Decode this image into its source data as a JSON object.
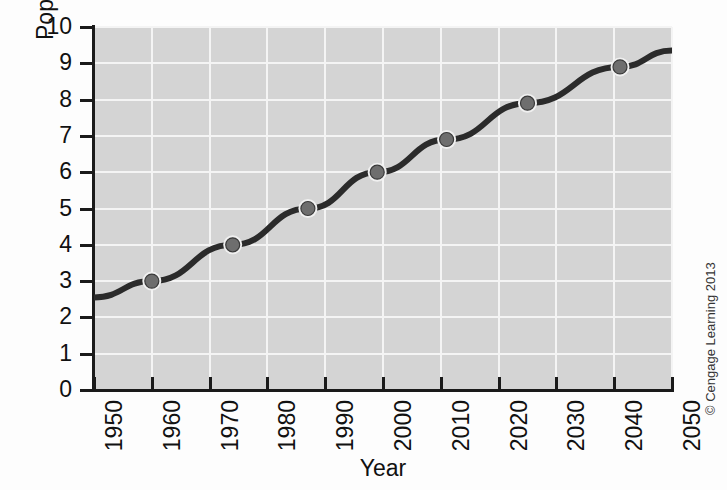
{
  "chart_data": {
    "type": "line",
    "title": "",
    "xlabel": "Year",
    "ylabel": "Population (billions)",
    "xlim": [
      1950,
      2050
    ],
    "ylim": [
      0,
      10
    ],
    "grid": true,
    "legend": false,
    "xticks": [
      "1950",
      "1960",
      "1970",
      "1980",
      "1990",
      "2000",
      "2010",
      "2020",
      "2030",
      "2040",
      "2050"
    ],
    "yticks": [
      "0",
      "1",
      "2",
      "3",
      "4",
      "5",
      "6",
      "7",
      "8",
      "9",
      "10"
    ],
    "series": [
      {
        "name": "World population",
        "x": [
          1950,
          1960,
          1974,
          1987,
          1999,
          2011,
          2025,
          2041,
          2050
        ],
        "values": [
          2.55,
          3.0,
          4.0,
          5.0,
          6.0,
          6.9,
          7.9,
          8.9,
          9.35
        ],
        "markers_at": [
          1960,
          1974,
          1987,
          1999,
          2011,
          2025,
          2041
        ],
        "line_color": "#2b2b2b",
        "marker_color": "#6e6e6e",
        "marker_edge_color": "#f0f0f0"
      }
    ],
    "plot_background": "#d4d4d4",
    "gridline_color": "#f4f4f4",
    "axis_color": "#1a1a1a"
  },
  "credit": {
    "text": "© Cengage Learning 2013"
  }
}
